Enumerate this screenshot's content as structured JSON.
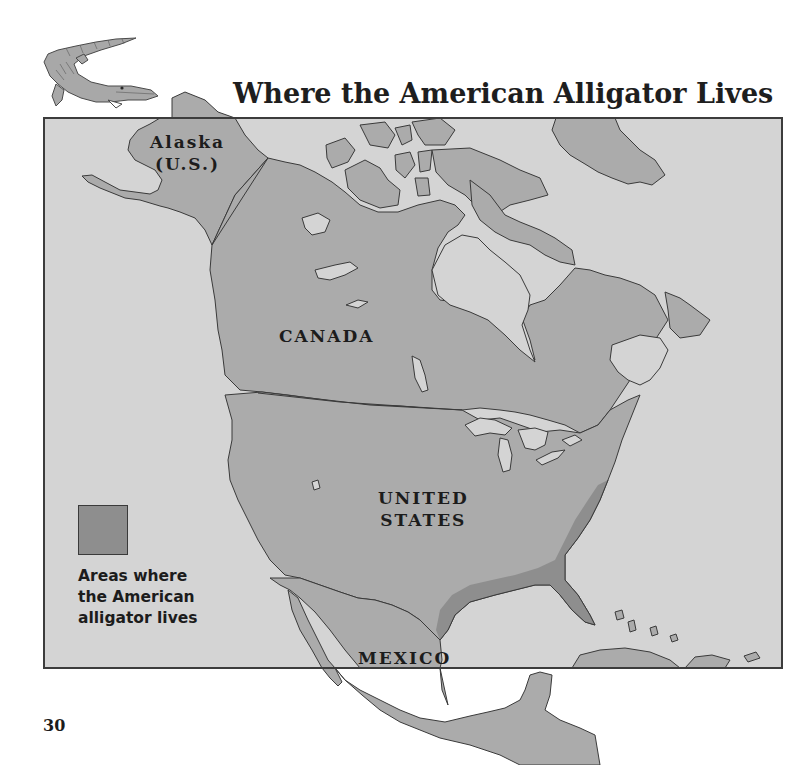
{
  "page": {
    "title": "Where the American Alligator Lives",
    "page_number": "30"
  },
  "map": {
    "labels": {
      "alaska_line1": "Alaska",
      "alaska_line2": "(U.S.)",
      "canada": "CANADA",
      "us_line1": "UNITED",
      "us_line2": "STATES",
      "mexico": "MEXICO"
    },
    "colors": {
      "water": "#d4d4d4",
      "land": "#ababab",
      "alligator_range": "#8e8e8e",
      "outline": "#3a3a3a",
      "frame": "#3c3c3c"
    },
    "legend": {
      "swatch_label": "alligator-range-swatch",
      "lines": [
        "Areas where",
        "the American",
        "alligator lives"
      ]
    }
  },
  "illustration": {
    "icon": "alligator-illustration"
  }
}
